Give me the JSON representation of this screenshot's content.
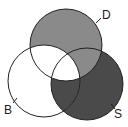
{
  "diagram": {
    "type": "venn-3",
    "sets": [
      {
        "id": "D",
        "label": "D",
        "cx": 66,
        "cy": 45,
        "r": 36,
        "fill": "#8a8a8a"
      },
      {
        "id": "B",
        "label": "B",
        "cx": 44,
        "cy": 81,
        "r": 36,
        "fill": "#ffffff"
      },
      {
        "id": "S",
        "label": "S",
        "cx": 87,
        "cy": 84,
        "r": 36,
        "fill": "#4a4a4a"
      }
    ],
    "regions": {
      "D_only": "#8a8a8a",
      "B_only": "#ffffff",
      "S_only": "#4a4a4a",
      "D_and_B": "#ffffff",
      "D_and_S": "#8a8a8a",
      "B_and_S": "#4a4a4a",
      "D_and_B_and_S": "#ffffff"
    },
    "stroke": "#222222"
  }
}
